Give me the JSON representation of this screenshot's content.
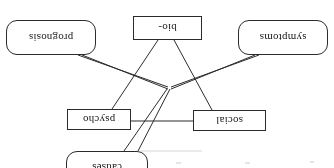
{
  "figure": {
    "orientation": "rotated-180",
    "stroke_color": "#2b2b2b",
    "background_color": "#ffffff"
  },
  "nodes": [
    {
      "id": "causes",
      "label": "causes",
      "shape": "rounded-rectangle",
      "x": 186,
      "y": -16,
      "w": 82,
      "h": 33
    },
    {
      "id": "social",
      "label": "social",
      "shape": "rectangle",
      "x": 68,
      "y": 37,
      "w": 73,
      "h": 21
    },
    {
      "id": "psycho",
      "label": "psycho",
      "shape": "rectangle",
      "x": 203,
      "y": 38,
      "w": 64,
      "h": 21
    },
    {
      "id": "bio",
      "label": "bio-",
      "shape": "rectangle",
      "x": 132,
      "y": 128,
      "w": 69,
      "h": 24
    },
    {
      "id": "symptoms",
      "label": "symptoms",
      "shape": "rounded-rectangle",
      "x": 6,
      "y": 113,
      "w": 90,
      "h": 35
    },
    {
      "id": "prognosis",
      "label": "prognosis",
      "shape": "rounded-rectangle",
      "x": 238,
      "y": 113,
      "w": 90,
      "h": 35
    }
  ],
  "hub": {
    "x": 164,
    "y": 79
  },
  "edges": [
    {
      "id": "social-psycho",
      "from": "social",
      "to": "psycho",
      "style": "single"
    },
    {
      "id": "social-bio",
      "from": "social",
      "to": "bio",
      "style": "single"
    },
    {
      "id": "psycho-bio",
      "from": "psycho",
      "to": "bio",
      "style": "single"
    },
    {
      "id": "causes-hub-a",
      "from": "causes",
      "to": "hub",
      "style": "single"
    },
    {
      "id": "causes-hub-b",
      "from": "causes",
      "to": "hub",
      "style": "single"
    },
    {
      "id": "hub-symptoms-a",
      "from": "hub",
      "to": "symptoms",
      "style": "single"
    },
    {
      "id": "hub-symptoms-b",
      "from": "hub",
      "to": "symptoms",
      "style": "single"
    },
    {
      "id": "hub-prognosis-a",
      "from": "hub",
      "to": "prognosis",
      "style": "single"
    },
    {
      "id": "hub-prognosis-b",
      "from": "hub",
      "to": "prognosis",
      "style": "single"
    }
  ]
}
